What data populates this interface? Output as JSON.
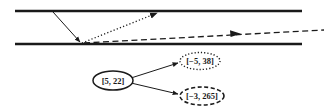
{
  "diagram": {
    "channel": {
      "top_wall": {
        "x1": 15,
        "y1": 11,
        "x2": 302,
        "y2": 11
      },
      "bottom_wall": {
        "x1": 15,
        "y1": 44,
        "x2": 302,
        "y2": 44
      }
    },
    "rays": {
      "incident": {
        "style": "solid",
        "x1": 53,
        "y1": 12,
        "x2": 80,
        "y2": 43
      },
      "reflected": {
        "style": "dotted",
        "x1": 82,
        "y1": 43,
        "x2": 158,
        "y2": 12
      },
      "transmitted": {
        "style": "dashed",
        "x1": 84,
        "y1": 43,
        "x2": 324,
        "y2": 30
      }
    },
    "tree": {
      "root": {
        "label": "[5, 22]",
        "style": "solid"
      },
      "children": [
        {
          "label": "[−5, 38]",
          "style": "dotted"
        },
        {
          "label": "[−3, 265]",
          "style": "dashed"
        }
      ]
    },
    "colors": {
      "stroke": "#1a1a1a",
      "background": "#ffffff"
    }
  }
}
